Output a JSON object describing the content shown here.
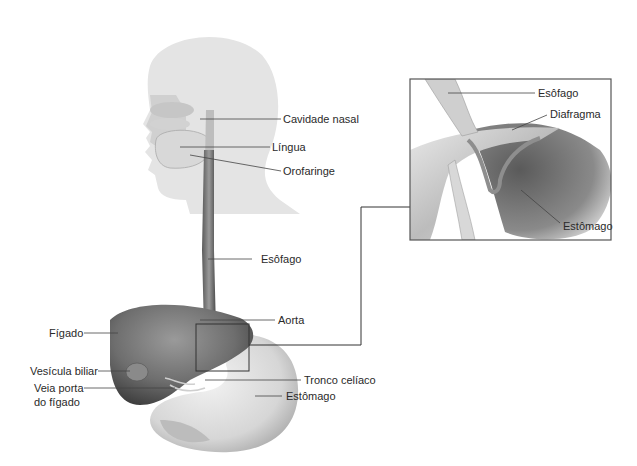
{
  "diagram": {
    "type": "anatomical-illustration",
    "colors": {
      "background": "#ffffff",
      "label_text": "#2a2a2a",
      "leader_line": "#444444",
      "inset_border": "#555555"
    }
  },
  "labels": {
    "cavidade_nasal": "Cavidade nasal",
    "lingua": "Língua",
    "orofaringe": "Orofaringe",
    "esofago": "Esôfago",
    "aorta": "Aorta",
    "figado": "Fígado",
    "vesicula_biliar": "Vesícula biliar",
    "veia_porta_line1": "Veia porta",
    "veia_porta_line2": "do fígado",
    "tronco_celiaco": "Tronco celíaco",
    "estomago": "Estômago"
  },
  "inset": {
    "esofago": "Esôfago",
    "diafragma": "Diafragma",
    "estomago": "Estômago"
  }
}
